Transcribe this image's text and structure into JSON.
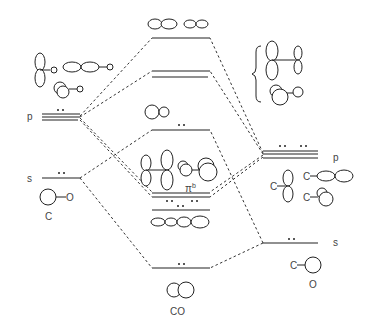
{
  "diagram": {
    "left_atom": {
      "label": "C",
      "levels": [
        {
          "name": "p",
          "label": "p",
          "electrons": "••"
        },
        {
          "name": "s",
          "label": "s",
          "electrons": "••"
        }
      ],
      "orbital_labels": [
        "O",
        "O",
        "O"
      ]
    },
    "right_atom": {
      "label": "O",
      "levels": [
        {
          "name": "p",
          "label": "p",
          "electrons": "•• ••"
        },
        {
          "name": "s",
          "label": "s",
          "electrons": "••"
        }
      ],
      "orbital_labels": [
        "C",
        "C",
        "C",
        "C"
      ]
    },
    "molecule": {
      "label": "CO",
      "levels": [
        {
          "name": "sigma-star",
          "electrons": ""
        },
        {
          "name": "pi-star",
          "electrons": ""
        },
        {
          "name": "sigma-nonbonding-5",
          "electrons": "••"
        },
        {
          "name": "pi-bonding",
          "label": "π",
          "superscript": "b",
          "electrons": "•• ••"
        },
        {
          "name": "sigma-4",
          "electrons": "••"
        },
        {
          "name": "sigma-3",
          "electrons": "••"
        }
      ]
    }
  }
}
